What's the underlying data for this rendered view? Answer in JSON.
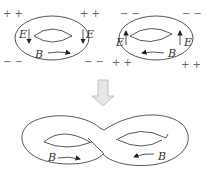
{
  "diagram": {
    "top_left_torus": {
      "charges_top": "+ +",
      "charges_top_right": "+ +",
      "charges_bottom": "− −",
      "charges_bottom_right": "− −",
      "field_left_label": "E",
      "field_right_label": "E",
      "field_direction": "down",
      "magnetic_label": "B",
      "magnetic_direction": "right"
    },
    "top_right_torus": {
      "charges_top": "− −",
      "charges_top_right": "− −",
      "charges_bottom": "+ +",
      "charges_bottom_right": "+ +",
      "field_left_label": "E",
      "field_right_label": "E",
      "field_direction": "up",
      "magnetic_label": "B",
      "magnetic_direction": "left"
    },
    "transition_arrow": {
      "direction": "down",
      "color": "#c8c8c8"
    },
    "figure_eight": {
      "left_label": "B",
      "left_direction": "right",
      "right_label": "B",
      "right_direction": "left"
    },
    "colors": {
      "stroke": "#444444",
      "text": "#333333",
      "charges": "#666666",
      "arrow_fill": "#e0e0e0"
    }
  }
}
